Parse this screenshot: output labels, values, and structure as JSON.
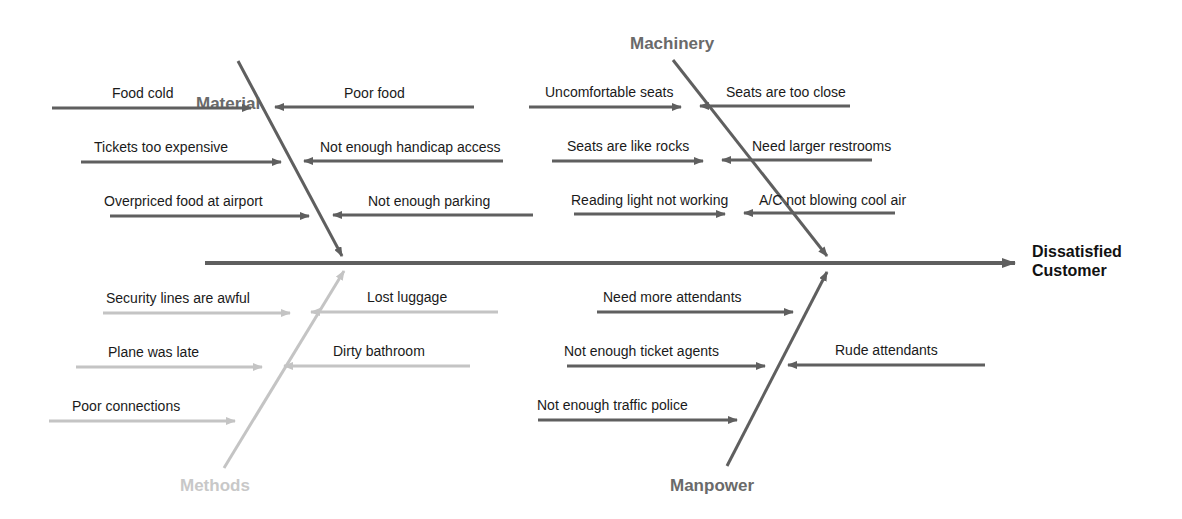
{
  "effect": {
    "line1": "Dissatisfied",
    "line2": "Customer"
  },
  "colors": {
    "dark": "#5f5f5f",
    "light": "#c4c4c4",
    "methods_label": "#c8c8c8",
    "category_label": "#6a6a6a"
  },
  "categories": {
    "material": {
      "label": "Material",
      "causes": [
        "Food cold",
        "Tickets too expensive",
        "Overpriced food at airport",
        "Poor food",
        "Not enough handicap access",
        "Not enough parking"
      ]
    },
    "machinery": {
      "label": "Machinery",
      "causes": [
        "Uncomfortable seats",
        "Seats are like rocks",
        "Reading light not working",
        "Seats are too close",
        "Need larger restrooms",
        "A/C not blowing cool air"
      ]
    },
    "methods": {
      "label": "Methods",
      "causes": [
        "Security lines are awful",
        "Plane was late",
        "Poor connections",
        "Lost luggage",
        "Dirty bathroom"
      ]
    },
    "manpower": {
      "label": "Manpower",
      "causes": [
        "Need more attendants",
        "Not enough ticket agents",
        "Not enough traffic police",
        "Rude attendants"
      ]
    }
  }
}
